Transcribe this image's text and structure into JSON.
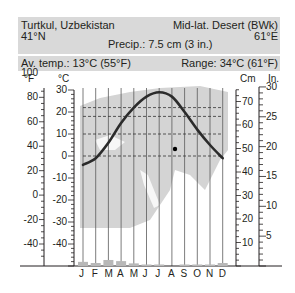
{
  "header": {
    "station": "Turtkul, Uzbekistan",
    "latitude": "41°N",
    "climate": "Mid-lat. Desert (BWk)",
    "longitude": "61°E",
    "precip": "Precip.: 7.5 cm (3 in.)",
    "avg_temp": "Av. temp.: 13°C (55°F)",
    "range": "Range: 34°C (61°F)"
  },
  "axes": {
    "f_unit": "°F",
    "c_unit": "°C",
    "cm_unit": "Cm",
    "in_unit": "In.",
    "f_ticks": [
      "100",
      "80",
      "60",
      "40",
      "20",
      "0",
      "-20",
      "-40"
    ],
    "c_ticks": [
      "30",
      "20",
      "10",
      "0",
      "-10",
      "-20",
      "-30",
      "-40"
    ],
    "cm_ticks": [
      "70",
      "60",
      "50",
      "40",
      "30",
      "20",
      "10"
    ],
    "in_ticks": [
      "30",
      "25",
      "20",
      "15",
      "10",
      "5"
    ]
  },
  "chart_data": {
    "type": "line",
    "categories": [
      "J",
      "F",
      "M",
      "A",
      "M",
      "J",
      "J",
      "A",
      "S",
      "O",
      "N",
      "D"
    ],
    "series": [
      {
        "name": "Temperature (°C)",
        "type": "line",
        "values": [
          -4,
          -1,
          6,
          15,
          22,
          27,
          29,
          27,
          20,
          12,
          5,
          -1
        ]
      },
      {
        "name": "Precipitation (cm)",
        "type": "bar",
        "values": [
          1.1,
          0.8,
          1.6,
          1.3,
          0.7,
          0.3,
          0.1,
          0.0,
          0.1,
          0.3,
          0.3,
          0.8
        ]
      }
    ],
    "dashed_reference_lines_c": [
      22,
      18,
      10,
      0
    ],
    "annual_marker": {
      "month": "A",
      "temp_c": 3
    },
    "ylim_c": [
      -45,
      35
    ],
    "ylim_cm": [
      0,
      75
    ],
    "xlabel": "",
    "ylabel_left": "°C / °F",
    "ylabel_right": "Cm / In."
  }
}
